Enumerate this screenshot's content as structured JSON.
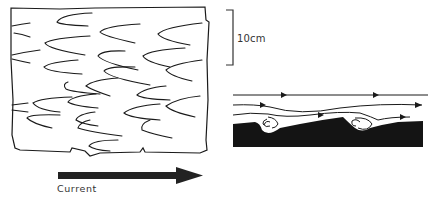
{
  "figure": {
    "plan_view": {
      "description": "Plan view of bedding surface with flute/scour marks",
      "mark_count": 24
    },
    "scale_bar": {
      "label": "10cm"
    },
    "section_view": {
      "description": "Cross-section showing flow lines with eddies over scoured bed",
      "flow_lines": 3,
      "eddies": 2
    },
    "current_arrow": {
      "label": "Current",
      "direction": "right"
    },
    "colors": {
      "ink": "#1a1a1a",
      "bed": "#141414",
      "background": "#ffffff"
    }
  }
}
